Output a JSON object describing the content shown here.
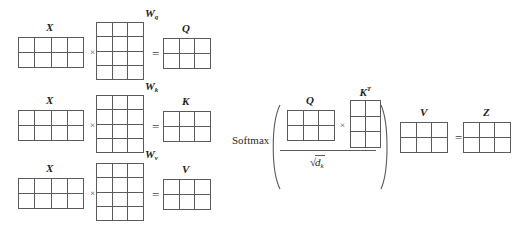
{
  "figure": {
    "background_color": "#ffffff",
    "line_color": "#5a5a5a",
    "text_color": "#1e1e1e"
  },
  "operators": {
    "times": "×",
    "equals": "=",
    "softmax": "Softmax"
  },
  "rows": [
    {
      "id": "query-row",
      "input": {
        "label": "X",
        "rows": 2,
        "cols": 4
      },
      "weight": {
        "label": "W",
        "subscript": "q",
        "rows": 4,
        "cols": 3
      },
      "output": {
        "label": "Q",
        "rows": 2,
        "cols": 3
      }
    },
    {
      "id": "key-row",
      "input": {
        "label": "X",
        "rows": 2,
        "cols": 4
      },
      "weight": {
        "label": "W",
        "subscript": "k",
        "rows": 4,
        "cols": 3
      },
      "output": {
        "label": "K",
        "rows": 2,
        "cols": 3
      }
    },
    {
      "id": "value-row",
      "input": {
        "label": "X",
        "rows": 2,
        "cols": 4
      },
      "weight": {
        "label": "W",
        "subscript": "v",
        "rows": 4,
        "cols": 3
      },
      "output": {
        "label": "V",
        "rows": 2,
        "cols": 3
      }
    }
  ],
  "attention": {
    "softmax_label": "Softmax",
    "numerator": {
      "q": {
        "label": "Q",
        "rows": 2,
        "cols": 3
      },
      "times": "×",
      "kt": {
        "label": "K",
        "superscript": "T",
        "rows": 3,
        "cols": 2
      }
    },
    "denominator": {
      "radical": "√",
      "base": "d",
      "subscript": "k",
      "text": "√dₖ"
    },
    "v": {
      "label": "V",
      "rows": 2,
      "cols": 3
    },
    "equals": "=",
    "z": {
      "label": "Z",
      "rows": 2,
      "cols": 3
    }
  }
}
